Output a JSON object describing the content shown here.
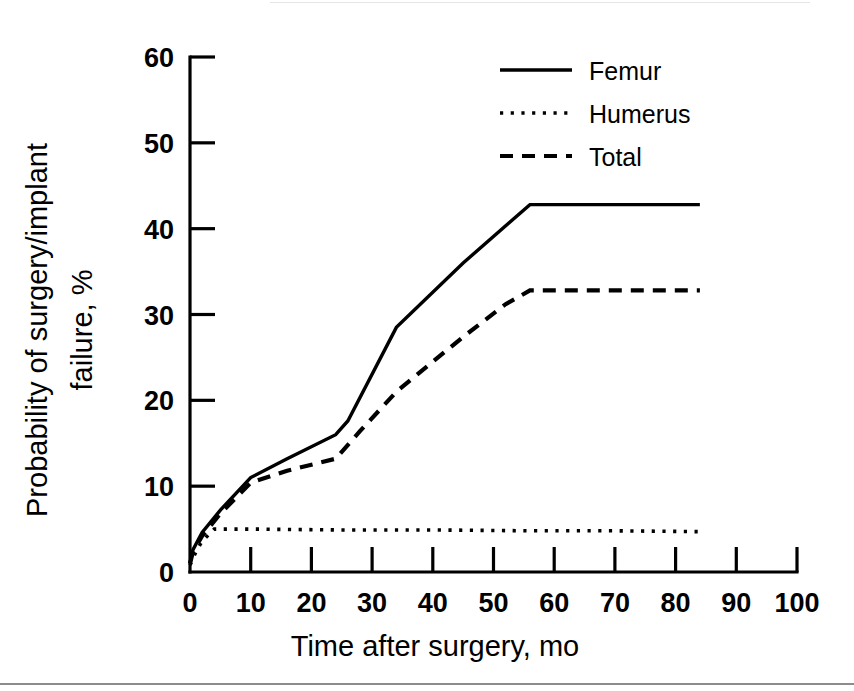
{
  "chart_data": {
    "type": "line",
    "title": "",
    "xlabel": "Time after surgery, mo",
    "ylabel_line1": "Probability of surgery/implant",
    "ylabel_line2": "failure, %",
    "xlim": [
      0,
      100
    ],
    "ylim": [
      0,
      60
    ],
    "xticks": [
      0,
      10,
      20,
      30,
      40,
      50,
      60,
      70,
      80,
      90,
      100
    ],
    "xticklabels": [
      "0",
      "10",
      "20",
      "30",
      "40",
      "50",
      "60",
      "70",
      "80",
      "90",
      "100"
    ],
    "yticks": [
      0,
      10,
      20,
      30,
      40,
      50,
      60
    ],
    "yticklabels": [
      "0",
      "10",
      "20",
      "30",
      "40",
      "50",
      "60"
    ],
    "grid": false,
    "legend_position": "upper right",
    "series": [
      {
        "name": "Femur",
        "style": "solid",
        "x": [
          0,
          0.5,
          2,
          5,
          10,
          16,
          24,
          26,
          34,
          45,
          56,
          62,
          70,
          84
        ],
        "y": [
          1.0,
          2.6,
          4.6,
          7.2,
          11.0,
          13.2,
          16.0,
          17.6,
          28.5,
          36.0,
          42.8,
          42.8,
          42.8,
          42.8
        ]
      },
      {
        "name": "Humerus",
        "style": "dotted",
        "x": [
          0,
          1,
          2,
          4,
          10,
          24,
          40,
          56,
          70,
          84
        ],
        "y": [
          0.8,
          2.4,
          3.6,
          5.0,
          5.0,
          4.9,
          4.9,
          4.8,
          4.8,
          4.7
        ]
      },
      {
        "name": "Total",
        "style": "dashed",
        "x": [
          0,
          0.5,
          2,
          5,
          10,
          16,
          24,
          28,
          34,
          45,
          52,
          56,
          62,
          70,
          84
        ],
        "y": [
          1.0,
          2.4,
          4.2,
          6.8,
          10.4,
          11.8,
          13.2,
          16.4,
          21.0,
          27.4,
          31.2,
          32.8,
          32.8,
          32.8,
          32.8
        ]
      }
    ]
  },
  "legend": {
    "items": [
      {
        "label": "Femur",
        "style": "solid"
      },
      {
        "label": "Humerus",
        "style": "dotted"
      },
      {
        "label": "Total",
        "style": "dashed"
      }
    ]
  },
  "colors": {
    "ink": "#000000",
    "background": "#ffffff",
    "rule": "#8c8c8c"
  }
}
